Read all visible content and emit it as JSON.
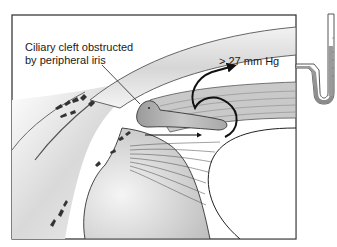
{
  "figure": {
    "annotations": {
      "cleft_line1": "Ciliary cleft obstructed",
      "cleft_line2": "by peripheral iris",
      "pressure": "> 27 mm Hg"
    },
    "colors": {
      "frame": "#2a2a2a",
      "tissue_light": "#e8e8e8",
      "tissue_mid": "#bdbdbd",
      "tissue_dark": "#7a7a7a",
      "arrow": "#111111",
      "manometer_fluid": "#9a9a9a",
      "background": "#ffffff"
    },
    "elements": [
      "cornea",
      "sclera",
      "iris",
      "ciliary-body",
      "lens",
      "aqueous-flow-arrow",
      "pressure-arrow",
      "manometer"
    ]
  }
}
